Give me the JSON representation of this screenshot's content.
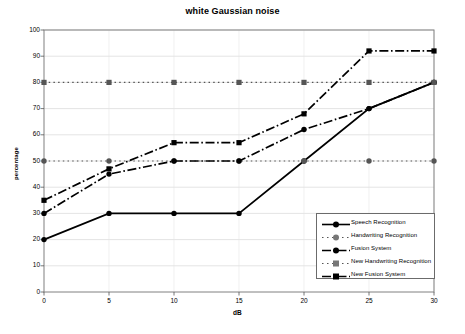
{
  "chart_data": {
    "type": "line",
    "title": "white Gaussian noise",
    "xlabel": "dB",
    "ylabel": "percentage",
    "x": [
      0,
      5,
      10,
      15,
      20,
      25,
      30
    ],
    "xlim": [
      0,
      30
    ],
    "ylim": [
      0,
      100
    ],
    "xticks": [
      "0",
      "5",
      "10",
      "15",
      "20",
      "25",
      "30"
    ],
    "yticks": [
      "0",
      "10",
      "20",
      "30",
      "40",
      "50",
      "60",
      "70",
      "80",
      "90",
      "100"
    ],
    "grid": true,
    "legend_position": "bottom-right",
    "series": [
      {
        "name": "Speech Recognition",
        "values": [
          20,
          30,
          30,
          30,
          50,
          70,
          80
        ],
        "color": "#000000",
        "dash": "solid",
        "marker": "circle"
      },
      {
        "name": "Handwriting Recognition",
        "values": [
          50,
          50,
          50,
          50,
          50,
          50,
          50
        ],
        "color": "#555555",
        "dash": "dotted",
        "marker": "circle"
      },
      {
        "name": "Fusion System",
        "values": [
          30,
          45,
          50,
          50,
          62,
          70,
          80
        ],
        "color": "#000000",
        "dash": "dashdot",
        "marker": "circle"
      },
      {
        "name": "New Handwriting Recognition",
        "values": [
          80,
          80,
          80,
          80,
          80,
          80,
          80
        ],
        "color": "#555555",
        "dash": "dashed",
        "marker": "square"
      },
      {
        "name": "New Fusion System",
        "values": [
          35,
          47,
          57,
          57,
          68,
          92,
          92
        ],
        "color": "#000000",
        "dash": "dashdot",
        "marker": "square"
      }
    ]
  },
  "legend": {
    "items": [
      {
        "label": "Speech Recognition"
      },
      {
        "label": "Handwriting Recognition"
      },
      {
        "label": "Fusion System"
      },
      {
        "label": "New Handwriting Recognition"
      },
      {
        "label": "New Fusion System"
      }
    ]
  }
}
